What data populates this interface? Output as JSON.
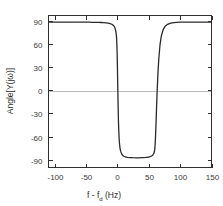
{
  "chart_data": {
    "type": "line",
    "title": "",
    "xlabel": "f - f_d (Hz)",
    "xlabel_main": "f - f",
    "xlabel_sub": "d",
    "xlabel_unit": " (Hz)",
    "ylabel": "Angle[Y(jω)]",
    "xlim": [
      -110,
      150
    ],
    "ylim": [
      -100,
      97
    ],
    "xticks": [
      -100,
      -50,
      0,
      50,
      100,
      150
    ],
    "xtick_labels": [
      "-100",
      "-50",
      "0",
      "50",
      "100",
      "150"
    ],
    "yticks": [
      90,
      60,
      30,
      0,
      -30,
      -60,
      -90
    ],
    "ytick_labels": [
      "90",
      "60",
      "30",
      "0",
      "-30",
      "-60",
      "-90"
    ],
    "grid": false,
    "legend": null,
    "zero_line": true,
    "zero_line_color": "#bdbdbd",
    "curve_color": "#2a2a2a",
    "frame_color": "#2f2f2f",
    "background_color": "#ffffff",
    "series": [
      {
        "name": "Angle[Y(jw)]",
        "description": "Phase response: +90 deg plateau outside the notch, dropping sharply to about -87 deg between 0 Hz and 60 Hz",
        "x": [
          -110,
          -105,
          -100,
          -95,
          -90,
          -85,
          -80,
          -75,
          -70,
          -65,
          -60,
          -55,
          -50,
          -45,
          -40,
          -35,
          -30,
          -26,
          -22,
          -18,
          -15,
          -12,
          -10,
          -8,
          -6.5,
          -5,
          -4,
          -3,
          -2.2,
          -1.5,
          -1,
          -0.5,
          0,
          0.5,
          1,
          1.5,
          2.2,
          3,
          4,
          5,
          6.5,
          8,
          10,
          13,
          16,
          20,
          25,
          30,
          34,
          38,
          42,
          45,
          48,
          51,
          53,
          55,
          56.5,
          58,
          59,
          59.8,
          60.5,
          61.3,
          62.2,
          63.2,
          64.5,
          66,
          68,
          70,
          73,
          76,
          80,
          85,
          90,
          95,
          100,
          108,
          116,
          124,
          132,
          140,
          150
        ],
        "y": [
          88.5,
          88.5,
          88.5,
          88.5,
          88.5,
          88.5,
          88.5,
          88.5,
          88.5,
          88.4,
          88.4,
          88.4,
          88.3,
          88.3,
          88.2,
          88.1,
          88.0,
          87.9,
          87.7,
          87.4,
          87.1,
          86.6,
          86.0,
          85.1,
          84.2,
          82.6,
          80.8,
          78.0,
          74.5,
          69.0,
          61.0,
          48.0,
          28.0,
          5.0,
          -18.0,
          -38.0,
          -55.0,
          -67.0,
          -74.5,
          -78.8,
          -82.0,
          -84.0,
          -85.4,
          -86.3,
          -86.8,
          -87.1,
          -87.3,
          -87.4,
          -87.4,
          -87.3,
          -87.2,
          -87.0,
          -86.7,
          -86.2,
          -85.7,
          -84.8,
          -83.8,
          -81.8,
          -79.0,
          -74.0,
          -64.0,
          -48.0,
          -26.0,
          -3.0,
          21.0,
          42.0,
          60.0,
          70.5,
          79.0,
          83.0,
          85.6,
          87.2,
          87.8,
          88.1,
          88.3,
          88.4,
          88.5,
          88.5,
          88.5,
          88.5,
          88.5
        ]
      }
    ]
  }
}
